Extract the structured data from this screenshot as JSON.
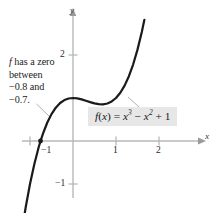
{
  "figure": {
    "annotation": {
      "line1_var": "f",
      "line1_rest": " has a zero",
      "line2": "between",
      "line3": "−0.8 and",
      "line4": "−0.7."
    },
    "function_label": {
      "fname": "f",
      "arg_open": "(",
      "argvar": "x",
      "arg_close": ")",
      "equals": " = ",
      "term1_base": "x",
      "term1_exp": "3",
      "op1": " − ",
      "term2_base": "x",
      "term2_exp": "2",
      "op2": " + ",
      "term3": "1",
      "plain": "f(x) = x³ − x² + 1",
      "background_color": "#e7e7e7"
    },
    "axis_labels": {
      "x": "x",
      "y": "y"
    },
    "tick_labels": {
      "x_neg1": "−1",
      "x_1": "1",
      "x_2": "2",
      "y_2": "2",
      "y_neg1": "−1"
    },
    "colors": {
      "curve": "#1a1a1a",
      "axis": "#b8b8b8",
      "text": "#1c1c1c",
      "leader": "#8c8c8c",
      "background": "#ffffff"
    }
  },
  "chart_data": {
    "type": "line",
    "title": "",
    "xlabel": "x",
    "ylabel": "y",
    "function": "f(x) = x^3 - x^2 + 1",
    "xlim": [
      -1.7,
      3.35
    ],
    "ylim": [
      -1.65,
      3.3
    ],
    "xticks": [
      -1,
      1,
      2
    ],
    "xtick_labels": [
      "−1",
      "1",
      "2"
    ],
    "yticks": [
      -1,
      2
    ],
    "ytick_labels": [
      "−1",
      "2"
    ],
    "grid": false,
    "legend": "none",
    "curve_domain": [
      -1.27,
      1.66
    ],
    "markers": [
      {
        "name": "zero",
        "x": -0.755,
        "y": 0,
        "label": "f has a zero between −0.8 and −0.7."
      }
    ],
    "x": [
      -1.27,
      -1.2,
      -1.1,
      -1.0,
      -0.9,
      -0.8,
      -0.755,
      -0.7,
      -0.6,
      -0.5,
      -0.4,
      -0.3,
      -0.2,
      -0.1,
      0.0,
      0.1,
      0.2,
      0.3,
      0.4,
      0.5,
      0.6,
      0.667,
      0.7,
      0.8,
      0.9,
      1.0,
      1.1,
      1.2,
      1.3,
      1.4,
      1.5,
      1.6,
      1.66
    ],
    "y": [
      -2.66,
      -2.17,
      -1.54,
      -1.0,
      -0.54,
      -0.152,
      0.0,
      0.167,
      0.424,
      0.625,
      0.776,
      0.883,
      0.952,
      0.989,
      1.0,
      0.991,
      0.968,
      0.937,
      0.904,
      0.875,
      0.856,
      0.852,
      0.853,
      0.872,
      0.919,
      1.0,
      1.121,
      1.288,
      1.507,
      1.784,
      2.125,
      2.536,
      2.818
    ]
  }
}
